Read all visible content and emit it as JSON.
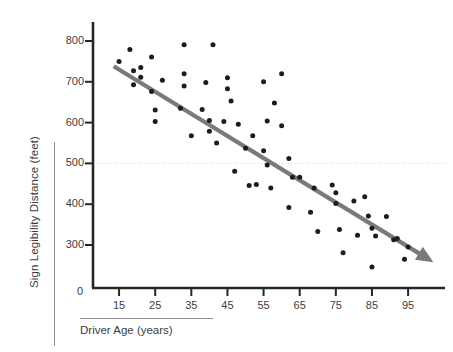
{
  "chart_data": {
    "type": "scatter",
    "title": "",
    "xlabel": "Driver Age (years)",
    "ylabel": "Sign Legibility Distance (feet)",
    "xlim": [
      10,
      103
    ],
    "ylim": [
      200,
      830
    ],
    "xticks": [
      15,
      25,
      35,
      45,
      55,
      65,
      75,
      85,
      95
    ],
    "yticks": [
      300,
      400,
      500,
      600,
      700,
      800
    ],
    "origin_label": "0",
    "grid": false,
    "legend": null,
    "reference_lines": [
      {
        "axis": "y",
        "value": 500,
        "style": "dotted",
        "color": "#d8d0d0"
      }
    ],
    "trendline": {
      "type": "linear-with-arrow",
      "color": "#7a7a7a",
      "x_start": 13.5,
      "y_start": 738,
      "x_end": 102,
      "y_end": 258
    },
    "series": [
      {
        "name": "Drivers",
        "marker": "filled-circle",
        "color": "#1c1c1c",
        "points": [
          [
            15,
            750
          ],
          [
            18,
            779
          ],
          [
            19,
            727
          ],
          [
            19,
            693
          ],
          [
            21,
            735
          ],
          [
            21,
            711
          ],
          [
            24,
            676
          ],
          [
            24,
            761
          ],
          [
            25,
            631
          ],
          [
            25,
            603
          ],
          [
            27,
            704
          ],
          [
            32,
            635
          ],
          [
            33,
            720
          ],
          [
            33,
            791
          ],
          [
            33,
            690
          ],
          [
            35,
            568
          ],
          [
            38,
            632
          ],
          [
            39,
            698
          ],
          [
            40,
            605
          ],
          [
            40,
            579
          ],
          [
            41,
            791
          ],
          [
            42,
            550
          ],
          [
            44,
            603
          ],
          [
            45,
            710
          ],
          [
            45,
            683
          ],
          [
            46,
            653
          ],
          [
            47,
            481
          ],
          [
            48,
            596
          ],
          [
            50,
            537
          ],
          [
            51,
            446
          ],
          [
            52,
            568
          ],
          [
            53,
            448
          ],
          [
            55,
            531
          ],
          [
            55,
            700
          ],
          [
            56,
            604
          ],
          [
            56,
            496
          ],
          [
            57,
            440
          ],
          [
            58,
            648
          ],
          [
            60,
            720
          ],
          [
            60,
            592
          ],
          [
            62,
            512
          ],
          [
            62,
            392
          ],
          [
            63,
            466
          ],
          [
            65,
            466
          ],
          [
            68,
            380
          ],
          [
            69,
            440
          ],
          [
            70,
            333
          ],
          [
            74,
            447
          ],
          [
            75,
            428
          ],
          [
            75,
            402
          ],
          [
            76,
            338
          ],
          [
            77,
            281
          ],
          [
            80,
            408
          ],
          [
            81,
            324
          ],
          [
            83,
            418
          ],
          [
            84,
            371
          ],
          [
            85,
            341
          ],
          [
            85,
            246
          ],
          [
            86,
            322
          ],
          [
            89,
            370
          ],
          [
            91,
            313
          ],
          [
            92,
            316
          ],
          [
            94,
            265
          ],
          [
            95,
            295
          ]
        ]
      }
    ]
  },
  "axis": {
    "y_tick_labels": [
      "800",
      "700",
      "600",
      "500",
      "400",
      "300"
    ],
    "x_tick_labels": [
      "15",
      "25",
      "35",
      "45",
      "55",
      "65",
      "75",
      "85",
      "95"
    ],
    "origin": "0"
  },
  "labels": {
    "y_axis_title": "Sign Legibility Distance (feet)",
    "x_axis_title": "Driver Age (years)"
  },
  "colors": {
    "point": "#1c1c1c",
    "trendline": "#7a7a7a",
    "axis": "#262626",
    "reference_line": "#ddd4d4",
    "text": "#3d3d3d",
    "rule": "#8f8f8f",
    "background": "#ffffff"
  }
}
